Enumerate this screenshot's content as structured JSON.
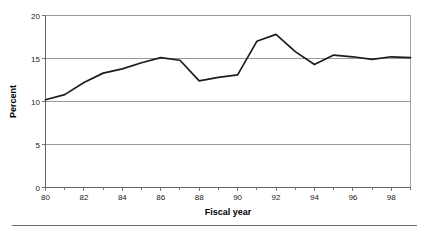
{
  "chart_data": {
    "type": "line",
    "title": "",
    "xlabel": "Fiscal year",
    "ylabel": "Percent",
    "xlim": [
      80,
      99
    ],
    "ylim": [
      0,
      20
    ],
    "grid": true,
    "legend": false,
    "x_tick_labels": [
      "80",
      "82",
      "84",
      "86",
      "88",
      "90",
      "92",
      "94",
      "96",
      "98"
    ],
    "x_tick_values": [
      80,
      82,
      84,
      86,
      88,
      90,
      92,
      94,
      96,
      98
    ],
    "x_minor_ticks": [
      81,
      83,
      85,
      87,
      89,
      91,
      93,
      95,
      97,
      99
    ],
    "y_tick_labels": [
      "0",
      "5",
      "10",
      "15",
      "20"
    ],
    "y_tick_values": [
      0,
      5,
      10,
      15,
      20
    ],
    "x": [
      80,
      81,
      82,
      83,
      84,
      85,
      86,
      87,
      88,
      89,
      90,
      91,
      92,
      93,
      94,
      95,
      96,
      97,
      98,
      99
    ],
    "values": [
      10.2,
      10.8,
      12.2,
      13.3,
      13.8,
      14.5,
      15.1,
      14.8,
      12.4,
      12.8,
      13.1,
      17.0,
      17.8,
      15.8,
      14.3,
      15.4,
      15.2,
      14.9,
      15.2,
      15.1
    ],
    "series": [
      {
        "name": "Percent",
        "color": "#1c1c1c",
        "values": [
          10.2,
          10.8,
          12.2,
          13.3,
          13.8,
          14.5,
          15.1,
          14.8,
          12.4,
          12.8,
          13.1,
          17.0,
          17.8,
          15.8,
          14.3,
          15.4,
          15.2,
          14.9,
          15.2,
          15.1
        ]
      }
    ]
  },
  "figure": {
    "background_color": "#ffffff",
    "line_color": "#1c1c1c",
    "gridline_color": "#808080",
    "frame_color": "#9a9a9a",
    "footer_rule_color": "#6e6e6e"
  }
}
